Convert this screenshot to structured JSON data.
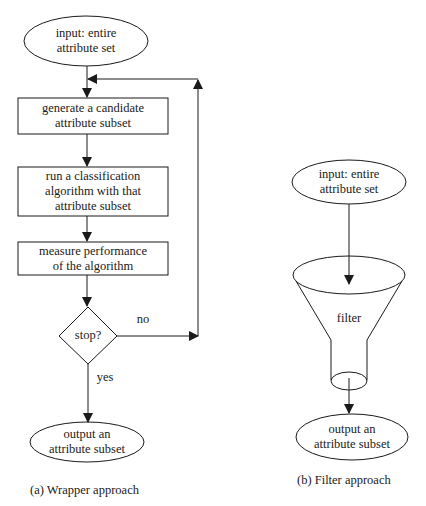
{
  "wrapper": {
    "input_line1": "input: entire",
    "input_line2": "attribute set",
    "step1_line1": "generate a candidate",
    "step1_line2": "attribute subset",
    "step2_line1": "run a classification",
    "step2_line2": "algorithm with that",
    "step2_line3": "attribute subset",
    "step3_line1": "measure performance",
    "step3_line2": "of the algorithm",
    "decision": "stop?",
    "no_label": "no",
    "yes_label": "yes",
    "output_line1": "output an",
    "output_line2": "attribute subset",
    "caption": "(a) Wrapper approach"
  },
  "filter": {
    "input_line1": "input: entire",
    "input_line2": "attribute set",
    "funnel_label": "filter",
    "output_line1": "output an",
    "output_line2": "attribute subset",
    "caption": "(b) Filter approach"
  },
  "colors": {
    "stroke": "#1a1a1a",
    "background": "#ffffff"
  }
}
